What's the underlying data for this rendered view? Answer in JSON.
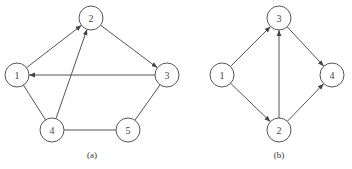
{
  "graphs": [
    {
      "id": "a",
      "caption": "(a)",
      "nodes": [
        {
          "label": "1",
          "x": 17,
          "y": 75
        },
        {
          "label": "2",
          "x": 91,
          "y": 18
        },
        {
          "label": "3",
          "x": 167,
          "y": 75
        },
        {
          "label": "4",
          "x": 52,
          "y": 130
        },
        {
          "label": "5",
          "x": 128,
          "y": 130
        }
      ],
      "edges": [
        {
          "from": "1",
          "to": "2",
          "directed": true
        },
        {
          "from": "4",
          "to": "2",
          "directed": true
        },
        {
          "from": "2",
          "to": "3",
          "directed": true
        },
        {
          "from": "3",
          "to": "1",
          "directed": true
        },
        {
          "from": "1",
          "to": "4",
          "directed": false
        },
        {
          "from": "4",
          "to": "5",
          "directed": false
        },
        {
          "from": "5",
          "to": "3",
          "directed": false
        }
      ]
    },
    {
      "id": "b",
      "caption": "(b)",
      "nodes": [
        {
          "label": "1",
          "x": 222,
          "y": 75
        },
        {
          "label": "3",
          "x": 279,
          "y": 18
        },
        {
          "label": "4",
          "x": 332,
          "y": 75
        },
        {
          "label": "2",
          "x": 279,
          "y": 130
        }
      ],
      "edges": [
        {
          "from": "1",
          "to": "3",
          "directed": true
        },
        {
          "from": "1",
          "to": "2",
          "directed": true
        },
        {
          "from": "2",
          "to": "3",
          "directed": true
        },
        {
          "from": "3",
          "to": "4",
          "directed": true
        },
        {
          "from": "2",
          "to": "4",
          "directed": true
        }
      ]
    }
  ],
  "captions": {
    "a": "(a)",
    "b": "(b)"
  },
  "node_radius": 12
}
